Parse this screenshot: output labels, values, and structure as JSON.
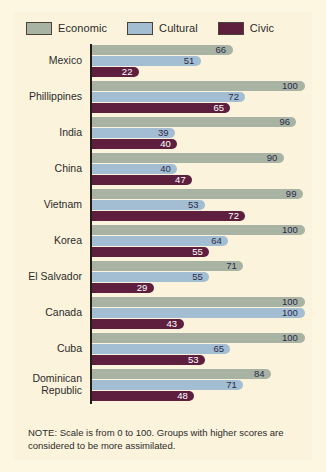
{
  "legend": {
    "items": [
      {
        "label": "Economic",
        "color": "#a8b3a4",
        "key": "economic"
      },
      {
        "label": "Cultural",
        "color": "#a3bdd3",
        "key": "cultural"
      },
      {
        "label": "Civic",
        "color": "#5e1f3f",
        "key": "civic"
      }
    ]
  },
  "note": "NOTE: Scale is from 0 to 100. Groups with higher scores are considered to be more assimilated.",
  "chart_data": {
    "type": "bar",
    "orientation": "horizontal",
    "title": "",
    "xlabel": "",
    "ylabel": "",
    "xlim": [
      0,
      100
    ],
    "grid": false,
    "legend_position": "top",
    "categories": [
      "Mexico",
      "Phillippines",
      "India",
      "China",
      "Vietnam",
      "Korea",
      "El Salvador",
      "Canada",
      "Cuba",
      "Dominican Republic"
    ],
    "series": [
      {
        "name": "Economic",
        "color": "#a8b3a4",
        "values": [
          66,
          100,
          96,
          90,
          99,
          100,
          71,
          100,
          100,
          84
        ]
      },
      {
        "name": "Cultural",
        "color": "#a3bdd3",
        "values": [
          51,
          72,
          39,
          40,
          53,
          64,
          55,
          100,
          65,
          71
        ]
      },
      {
        "name": "Civic",
        "color": "#5e1f3f",
        "values": [
          22,
          65,
          40,
          47,
          72,
          55,
          29,
          43,
          53,
          48
        ]
      }
    ]
  }
}
